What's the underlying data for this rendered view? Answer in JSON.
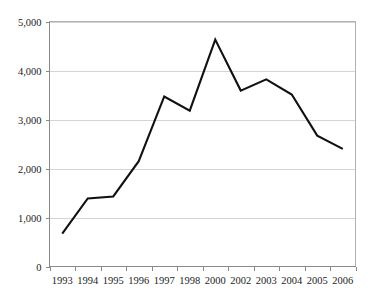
{
  "chart_data": {
    "type": "line",
    "title": "",
    "subtitle": "",
    "xlabel": "",
    "ylabel": "",
    "categories": [
      "1993",
      "1994",
      "1995",
      "1996",
      "1997",
      "1998",
      "2000",
      "2002",
      "2003",
      "2004",
      "2005",
      "2006"
    ],
    "values": [
      670,
      1390,
      1430,
      2150,
      3470,
      3180,
      4630,
      3590,
      3820,
      3510,
      2670,
      2400
    ],
    "series": [
      {
        "name": "",
        "values": [
          670,
          1390,
          1430,
          2150,
          3470,
          3180,
          4630,
          3590,
          3820,
          3510,
          2670,
          2400
        ],
        "color": "#111111"
      }
    ],
    "ylim": [
      0,
      5000
    ],
    "y_ticks": [
      0,
      1000,
      2000,
      3000,
      4000,
      5000
    ],
    "y_tick_labels": [
      "0",
      "1,000",
      "2,000",
      "3,000",
      "4,000",
      "5,000"
    ],
    "x_tick_labels": [
      "1993",
      "1994",
      "1995",
      "1996",
      "1997",
      "1998",
      "2000",
      "2002",
      "2003",
      "2004",
      "2005",
      "2006"
    ],
    "grid": true,
    "grid_axis": "y",
    "legend": false,
    "legend_position": "none",
    "annotations": [],
    "colors": {
      "line": "#111111",
      "gridline": "#d4d4d4",
      "axis": "#8a8a8a",
      "border": "#b0b0b0",
      "background": "#ffffff",
      "text": "#1c1c1c"
    }
  }
}
